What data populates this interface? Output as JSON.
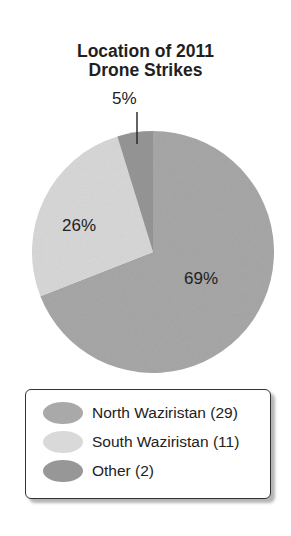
{
  "chart_data": {
    "type": "pie",
    "title": "Location of 2011 Drone Strikes",
    "title_lines": [
      "Location of 2011",
      "Drone Strikes"
    ],
    "slices": [
      {
        "name": "North Waziristan",
        "count": 29,
        "percent": 69,
        "label": "69%",
        "color": "#a9a9a9"
      },
      {
        "name": "South Waziristan",
        "count": 11,
        "percent": 26,
        "label": "26%",
        "color": "#d9d9d9"
      },
      {
        "name": "Other",
        "count": 2,
        "percent": 5,
        "label": "5%",
        "color": "#979797"
      }
    ],
    "legend": [
      "North Waziristan (29)",
      "South Waziristan (11)",
      "Other (2)"
    ],
    "legend_position": "bottom",
    "start_angle": "12 o'clock, clockwise"
  }
}
